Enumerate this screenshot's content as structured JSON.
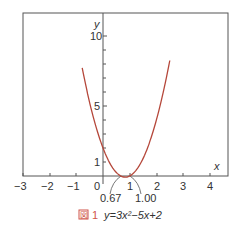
{
  "chart_data": {
    "type": "line",
    "title": "",
    "caption": {
      "figure_mark": "図",
      "number": "1",
      "equation": "y=3x²−5x+2"
    },
    "xlabel": "x",
    "ylabel": "y",
    "xlim": [
      -3,
      4.5
    ],
    "ylim": [
      0,
      11
    ],
    "x_ticks": [
      "−3",
      "−2",
      "−1",
      "0",
      "1",
      "2",
      "3",
      "4"
    ],
    "y_ticks": [
      "1",
      "5",
      "10"
    ],
    "annotations": [
      "0.67",
      "1.00"
    ],
    "series": [
      {
        "name": "y=3x²−5x+2",
        "color": "#b5473a",
        "x": [
          -0.78,
          -0.5,
          0,
          0.5,
          0.67,
          0.83,
          1.0,
          1.5,
          2.0,
          2.5
        ],
        "y": [
          7.73,
          5.25,
          2.0,
          0.25,
          0.0,
          -0.08,
          0.0,
          1.25,
          4.0,
          8.25
        ]
      }
    ],
    "grid": false
  }
}
